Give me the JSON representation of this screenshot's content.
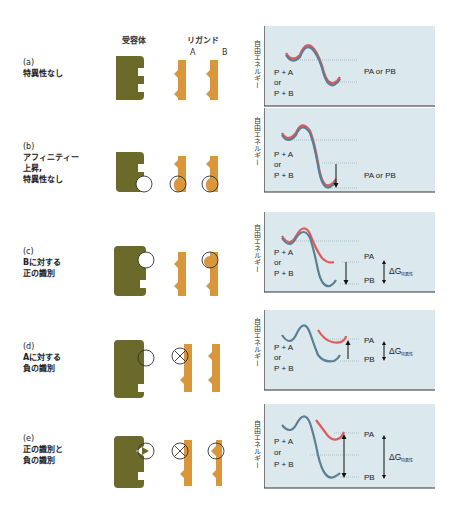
{
  "header": {
    "receptor": "受容体",
    "ligand": "リガンド",
    "ligand_a": "A",
    "ligand_b": "B"
  },
  "colors": {
    "receptor": "#6b6a2a",
    "ligand": "#d9963a",
    "panel_bg": "#dbe8ee",
    "curve_blue": "#5b7f90",
    "curve_red": "#e05a5a",
    "axis": "#333333"
  },
  "y_axis_label": "自由エネルギー",
  "rows": [
    {
      "tag": "(a)",
      "text": "特異性なし",
      "left": "P + A",
      "or": "or",
      "right_left": "P + B",
      "result": "PA or PB"
    },
    {
      "tag": "(b)",
      "text": "アフィニティー\n上昇,\n特異性なし",
      "left": "P + A",
      "or": "or",
      "right_left": "P + B",
      "result": "PA or PB"
    },
    {
      "tag": "(c)",
      "text": "Bに対する\n正の識別",
      "left": "P + A",
      "or": "or",
      "right_left": "P + B",
      "pa": "PA",
      "pb": "PB",
      "dg": "ΔG",
      "dg_sub": "特異性"
    },
    {
      "tag": "(d)",
      "text": "Aに対する\n負の識別",
      "left": "P + A",
      "or": "or",
      "right_left": "P + B",
      "pa": "PA",
      "pb": "PB",
      "dg": "ΔG",
      "dg_sub": "特異性"
    },
    {
      "tag": "(e)",
      "text": "正の識別と\n負の識別",
      "left": "P + A",
      "or": "or",
      "right_left": "P + B",
      "pa": "PA",
      "pb": "PB",
      "dg": "ΔG",
      "dg_sub": "特異性"
    }
  ]
}
